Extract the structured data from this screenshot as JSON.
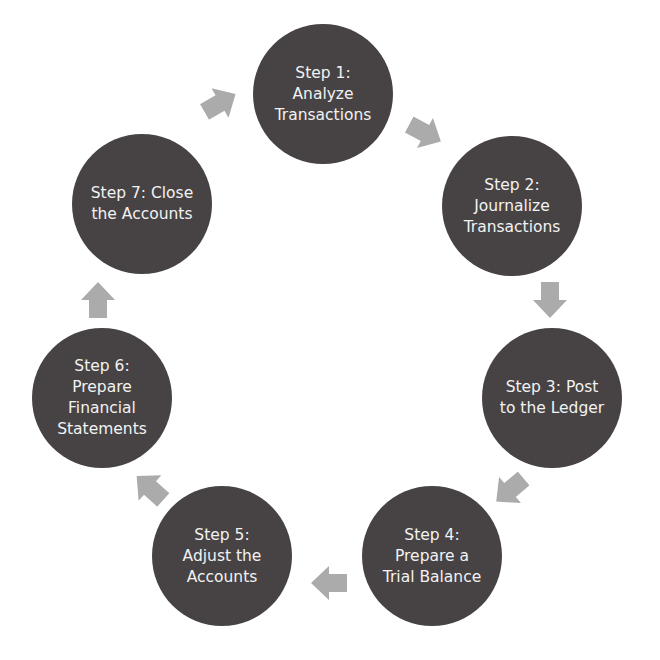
{
  "diagram": {
    "type": "cycle",
    "colors": {
      "circle_fill": "#474344",
      "circle_text": "#f2f2f2",
      "arrow_fill": "#ababab",
      "background": "#ffffff"
    },
    "steps": [
      {
        "label": "Step 1:\nAnalyze\nTransactions",
        "cx": 323,
        "cy": 94
      },
      {
        "label": "Step 2:\nJournalize\nTransactions",
        "cx": 512,
        "cy": 206
      },
      {
        "label": "Step 3: Post\nto the Ledger",
        "cx": 552,
        "cy": 398
      },
      {
        "label": "Step 4:\nPrepare a\nTrial Balance",
        "cx": 432,
        "cy": 556
      },
      {
        "label": "Step 5:\nAdjust the\nAccounts",
        "cx": 222,
        "cy": 556
      },
      {
        "label": "Step 6:\nPrepare\nFinancial\nStatements",
        "cx": 102,
        "cy": 398
      },
      {
        "label": "Step 7: Close\nthe Accounts",
        "cx": 142,
        "cy": 204
      }
    ],
    "arrows": [
      {
        "from": 1,
        "to": 2,
        "direction": "down-right"
      },
      {
        "from": 2,
        "to": 3,
        "direction": "down"
      },
      {
        "from": 3,
        "to": 4,
        "direction": "down-left"
      },
      {
        "from": 4,
        "to": 5,
        "direction": "left"
      },
      {
        "from": 5,
        "to": 6,
        "direction": "up-left"
      },
      {
        "from": 6,
        "to": 7,
        "direction": "up"
      },
      {
        "from": 7,
        "to": 1,
        "direction": "up-right"
      }
    ]
  }
}
